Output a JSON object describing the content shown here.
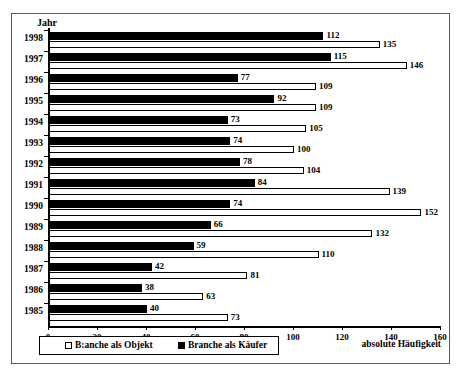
{
  "chart_data": {
    "type": "bar",
    "orientation": "horizontal",
    "title": "",
    "xlabel": "absolute Häufigkeit",
    "ylabel": "Jahr",
    "xlim": [
      0,
      160
    ],
    "xticks": [
      0,
      20,
      40,
      60,
      80,
      100,
      120,
      140,
      160
    ],
    "grid": false,
    "legend_position": "bottom-left",
    "categories": [
      "1998",
      "1997",
      "1996",
      "1995",
      "1994",
      "1993",
      "1992",
      "1991",
      "1990",
      "1989",
      "1988",
      "1987",
      "1986",
      "1985"
    ],
    "series": [
      {
        "name": "Branche als Käufer",
        "color": "#000000",
        "values": [
          112,
          115,
          77,
          92,
          73,
          74,
          78,
          84,
          74,
          66,
          59,
          42,
          38,
          40
        ]
      },
      {
        "name": "B:anche als Objekt",
        "color": "#ffffff",
        "values": [
          135,
          146,
          109,
          109,
          105,
          100,
          104,
          139,
          152,
          132,
          110,
          81,
          63,
          73
        ]
      }
    ]
  },
  "axis": {
    "y_title": "Jahr",
    "x_title": "absolute Häufigkeit"
  },
  "legend": {
    "objekt_label": "B:anche als Objekt",
    "kaeufer_label": "Branche als Käufer"
  }
}
